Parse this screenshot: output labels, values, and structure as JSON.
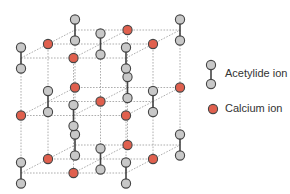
{
  "diagram": {
    "type": "crystal-lattice",
    "colors": {
      "acetylide_fill": "#c8c8c8",
      "calcium_fill": "#e0604e",
      "stroke": "#444444",
      "grid_line": "#999999"
    },
    "lattice": {
      "origin": [
        21,
        58
      ],
      "col_step": [
        52.5,
        0
      ],
      "row_step": [
        0,
        57.5
      ],
      "depth_step": [
        27,
        -14
      ],
      "pair_half_height": 10.5,
      "node_radius": 4.6
    }
  },
  "legend": {
    "items": [
      {
        "label": "Acetylide ion",
        "symbol": "acetylide-pair"
      },
      {
        "label": "Calcium ion",
        "symbol": "calcium-dot"
      }
    ]
  }
}
